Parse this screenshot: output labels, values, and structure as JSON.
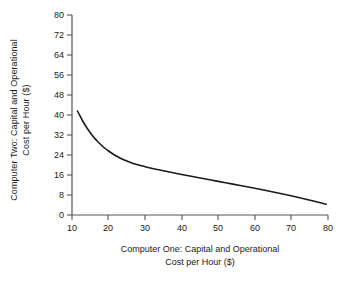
{
  "chart_data": {
    "type": "line",
    "title": "",
    "xlabel": "Computer One: Capital and Operational Cost per Hour ($)",
    "xlabel_line1": "Computer One: Capital and Operational",
    "xlabel_line2": "Cost per Hour ($)",
    "ylabel": "Computer Two: Capital and Operational Cost per Hour ($)",
    "ylabel_line1": "Computer Two: Capital and Operational",
    "ylabel_line2": "Cost per Hour ($)",
    "xlim": [
      10,
      80
    ],
    "ylim": [
      0,
      80
    ],
    "xticks": [
      10,
      20,
      30,
      40,
      50,
      60,
      70,
      80
    ],
    "yticks": [
      0,
      8,
      16,
      24,
      32,
      40,
      48,
      56,
      64,
      72,
      80
    ],
    "grid": false,
    "legend": "none",
    "line_color": "#1a1a1a",
    "line_width": 1.6,
    "series": [
      {
        "name": "Isocost frontier",
        "x": [
          11.5,
          12,
          13,
          14,
          15,
          16,
          17,
          18,
          19,
          20,
          21,
          22,
          23,
          24,
          25,
          26,
          27,
          28,
          29,
          30,
          32,
          34,
          36,
          38,
          40,
          44,
          48,
          52,
          56,
          60,
          64,
          68,
          72,
          76,
          79.5
        ],
        "y": [
          41.6,
          40.2,
          37.4,
          35.0,
          32.9,
          31.0,
          29.4,
          28.0,
          26.7,
          25.6,
          24.6,
          23.7,
          22.9,
          22.2,
          21.6,
          21.0,
          20.5,
          20.1,
          19.7,
          19.3,
          18.6,
          18.0,
          17.4,
          16.8,
          16.2,
          15.1,
          14.0,
          12.9,
          11.8,
          10.7,
          9.5,
          8.3,
          7.0,
          5.6,
          4.3
        ]
      }
    ]
  },
  "axis": {
    "yticks_text": [
      "80",
      "72",
      "64",
      "56",
      "48",
      "40",
      "32",
      "24",
      "16",
      "8",
      "0"
    ],
    "xticks_text": [
      "10",
      "20",
      "30",
      "40",
      "50",
      "60",
      "70",
      "80"
    ]
  }
}
